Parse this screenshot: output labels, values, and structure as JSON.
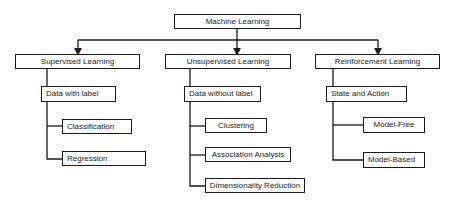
{
  "diagram": {
    "type": "tree",
    "line_color": "#1a1a1a",
    "root": {
      "label": "Machine Learning"
    },
    "branches": [
      {
        "label": "Supervised Learning",
        "sub": {
          "label": "Data with label"
        },
        "leaves": [
          {
            "label": "Classification"
          },
          {
            "label": "Regression"
          }
        ]
      },
      {
        "label": "Unsupervised Learning",
        "sub": {
          "label": "Data without label"
        },
        "leaves": [
          {
            "label": "Clustering"
          },
          {
            "label": "Association Analysis"
          },
          {
            "label": "Dimensionality Reduction"
          }
        ]
      },
      {
        "label": "Reinforcement Learning",
        "sub": {
          "label": "State and Action"
        },
        "leaves": [
          {
            "label": "Model-Free"
          },
          {
            "label": "Model-Based"
          }
        ]
      }
    ]
  }
}
